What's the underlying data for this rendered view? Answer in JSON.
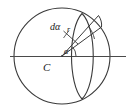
{
  "figure": {
    "kind": "geometry-diagram",
    "stroke_color": "#3a3a3a",
    "text_color": "#1a1a1a",
    "background_color": "#ffffff",
    "labels": {
      "differential_angle": "dα",
      "radius": "r",
      "angle": "α",
      "centre": "C"
    },
    "geometry": {
      "circle": {
        "cx": 62,
        "cy": 56,
        "r": 48
      },
      "centre_point": {
        "x": 62,
        "y": 56
      },
      "horizontal_line": {
        "x1": 10,
        "y1": 56,
        "x2": 126,
        "y2": 56
      },
      "lens_arcs": [
        {
          "name": "lens-left-arc",
          "from": [
            82,
            14
          ],
          "to": [
            82,
            99
          ]
        },
        {
          "name": "lens-right-arc",
          "from": [
            82,
            14
          ],
          "to": [
            82,
            99
          ]
        }
      ],
      "rays": [
        {
          "name": "ray-upper",
          "from": [
            62,
            56
          ],
          "to": [
            97,
            15
          ]
        },
        {
          "name": "ray-lower",
          "from": [
            62,
            56
          ],
          "to": [
            101,
            27
          ]
        }
      ],
      "angle_arc": {
        "cx": 62,
        "cy": 56,
        "r": 13,
        "start_deg": 0,
        "end_deg": 42
      },
      "leader_line": {
        "from": [
          62,
          31
        ],
        "to": [
          76,
          42
        ]
      }
    }
  }
}
